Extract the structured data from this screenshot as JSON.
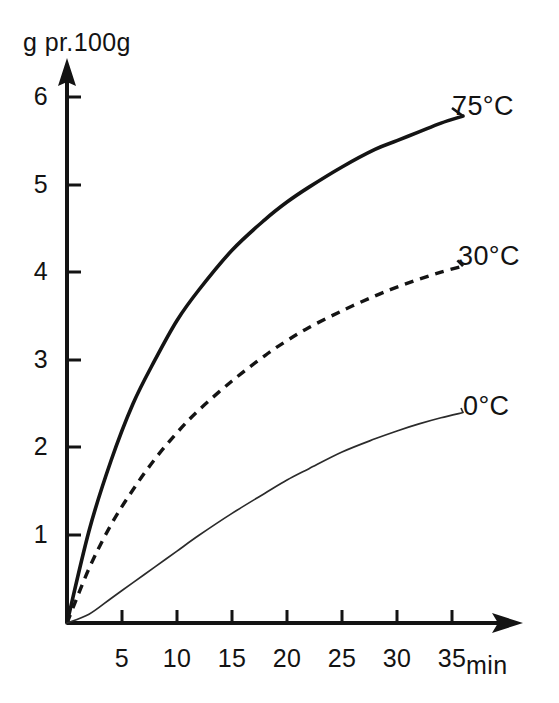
{
  "chart_data": {
    "type": "line",
    "title": "",
    "xlabel": "min",
    "ylabel": "g pr.100g",
    "xlim": [
      0,
      38
    ],
    "ylim": [
      0,
      6.4
    ],
    "grid": false,
    "legend_position": "inline-right-of-curve",
    "x_ticks": [
      5,
      10,
      15,
      20,
      25,
      30,
      35
    ],
    "y_ticks": [
      1,
      2,
      3,
      4,
      5,
      6
    ],
    "x": [
      0,
      2,
      4,
      6,
      8,
      10,
      12,
      15,
      18,
      20,
      22,
      25,
      28,
      30,
      32,
      34,
      36
    ],
    "series": [
      {
        "name": "75°C",
        "style": "solid-thick",
        "color": "#141414",
        "values": [
          0,
          1.05,
          1.85,
          2.5,
          3.0,
          3.45,
          3.8,
          4.25,
          4.6,
          4.8,
          4.97,
          5.2,
          5.4,
          5.5,
          5.6,
          5.7,
          5.78
        ]
      },
      {
        "name": "30°C",
        "style": "dashed",
        "color": "#141414",
        "values": [
          0,
          0.62,
          1.12,
          1.52,
          1.87,
          2.17,
          2.43,
          2.76,
          3.05,
          3.22,
          3.37,
          3.56,
          3.73,
          3.83,
          3.92,
          4.0,
          4.07
        ]
      },
      {
        "name": "0°C",
        "style": "solid-thin",
        "color": "#2b2b2b",
        "values": [
          0,
          0.1,
          0.28,
          0.46,
          0.64,
          0.82,
          1.0,
          1.25,
          1.48,
          1.63,
          1.76,
          1.95,
          2.1,
          2.19,
          2.27,
          2.34,
          2.4
        ]
      }
    ]
  },
  "axes": {
    "y_title": "g pr.100g",
    "x_title": "min",
    "y_tick_labels": [
      "6",
      "5",
      "4",
      "3",
      "2",
      "1"
    ],
    "x_tick_labels": [
      "5",
      "10",
      "15",
      "20",
      "25",
      "30",
      "35"
    ]
  },
  "series_labels": {
    "hot": "75°C",
    "warm": "30°C",
    "cold": "0°C"
  }
}
